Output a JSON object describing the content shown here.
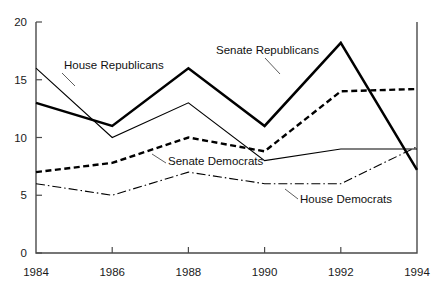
{
  "chart_data": {
    "type": "line",
    "title": "",
    "subtitle": "",
    "xlabel": "",
    "ylabel": "",
    "x": [
      1984,
      1986,
      1988,
      1990,
      1992,
      1994
    ],
    "xtick_labels": [
      "1984",
      "1986",
      "1988",
      "1990",
      "1992",
      "1994"
    ],
    "ytick_labels": [
      "0",
      "5",
      "10",
      "15",
      "20"
    ],
    "yticks": [
      0,
      5,
      10,
      15,
      20
    ],
    "ylim": [
      0,
      20
    ],
    "xlim": [
      1984,
      1994
    ],
    "grid": false,
    "legend_position": "inline-annotations",
    "series": [
      {
        "name": "House Republicans",
        "style": "thin-solid",
        "values": [
          16.0,
          10.0,
          13.0,
          8.0,
          9.0,
          9.0
        ]
      },
      {
        "name": "Senate Republicans",
        "style": "thick-solid",
        "values": [
          13.0,
          11.0,
          16.0,
          11.0,
          18.2,
          7.2
        ]
      },
      {
        "name": "Senate Democrats",
        "style": "thick-dashed",
        "values": [
          7.0,
          7.8,
          10.0,
          8.8,
          14.0,
          14.2
        ]
      },
      {
        "name": "House Democrats",
        "style": "thin-dashdot",
        "values": [
          6.0,
          5.0,
          7.0,
          6.0,
          6.0,
          9.2
        ]
      }
    ],
    "annotations": [
      {
        "text": "House Republicans",
        "x": 64,
        "y": 69
      },
      {
        "text": "Senate Republicans",
        "x": 216,
        "y": 54
      },
      {
        "text": "Senate Democrats",
        "x": 168,
        "y": 165
      },
      {
        "text": "House Democrats",
        "x": 300,
        "y": 203
      }
    ],
    "colors": {
      "line": "#000000",
      "axis": "#4a4a4a",
      "text": "#1a1a1a",
      "background": "#ffffff"
    }
  }
}
